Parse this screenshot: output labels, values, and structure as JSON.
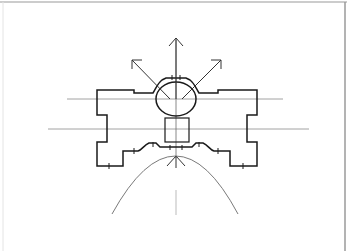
{
  "diagram": {
    "type": "architectural-plan",
    "colors": {
      "background": "#ffffff",
      "ink": "#1a1a1a",
      "axis": "#8a8a8a",
      "curve": "#6a6a6a",
      "border": "#9a9a9a"
    },
    "elements": {
      "oval_room": {
        "cx": 176,
        "cy": 99,
        "rx": 20,
        "ry": 17
      },
      "square_room": {
        "x": 165,
        "y": 118,
        "w": 24,
        "h": 24
      },
      "axes": [
        {
          "name": "upper-horizontal-axis",
          "y": 99,
          "x1": 67,
          "x2": 283
        },
        {
          "name": "lower-horizontal-axis",
          "y": 129,
          "x1": 48,
          "x2": 309
        },
        {
          "name": "vertical-axis",
          "x": 176,
          "y1": 40,
          "y2": 220
        }
      ],
      "arrows": [
        {
          "name": "arrow-north",
          "from": [
            176,
            99
          ],
          "to": [
            176,
            38
          ]
        },
        {
          "name": "arrow-northwest",
          "from": [
            170,
            99
          ],
          "to": [
            132,
            60
          ]
        },
        {
          "name": "arrow-northeast",
          "from": [
            182,
            99
          ],
          "to": [
            221,
            60
          ]
        }
      ],
      "parabola": {
        "apex": [
          176,
          156
        ],
        "left_end": [
          112,
          214
        ],
        "right_end": [
          238,
          214
        ]
      }
    }
  }
}
